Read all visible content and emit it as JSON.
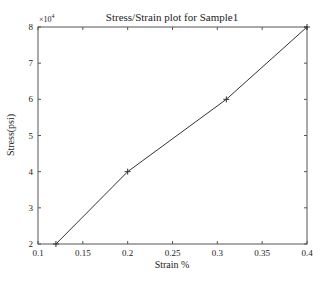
{
  "chart_data": {
    "type": "line",
    "title": "Stress/Strain plot for Sample1",
    "xlabel": "Strain %",
    "ylabel": "Stress(psi)",
    "y_multiplier": "×10",
    "y_exponent": "4",
    "xlim": [
      0.1,
      0.4
    ],
    "ylim": [
      2,
      8
    ],
    "x_ticks": [
      "0.1",
      "0.15",
      "0.2",
      "0.25",
      "0.3",
      "0.35",
      "0.4"
    ],
    "y_ticks": [
      "2",
      "3",
      "4",
      "5",
      "6",
      "7",
      "8"
    ],
    "grid": false,
    "series": [
      {
        "name": "Sample1",
        "marker": "+",
        "color": "#333333",
        "x": [
          0.12,
          0.2,
          0.31,
          0.4
        ],
        "y": [
          20000,
          40000,
          60000,
          80000
        ]
      }
    ]
  }
}
